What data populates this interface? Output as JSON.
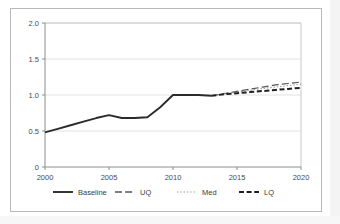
{
  "figure": {
    "frame_border_color": "#b9b9b9",
    "background_color": "#ffffff"
  },
  "chart_data": {
    "type": "line",
    "title": "",
    "subtitle": "",
    "xlabel": "",
    "ylabel": "",
    "xlim": [
      2000,
      2020
    ],
    "ylim": [
      0,
      2.0
    ],
    "xticks": [
      2000,
      2005,
      2010,
      2015,
      2020
    ],
    "xticklabels": [
      "2000",
      "2005",
      "2010",
      "2015",
      "2020"
    ],
    "yticks": [
      0,
      0.5,
      1.0,
      1.5,
      2.0
    ],
    "yticklabels": [
      "0",
      "0.5",
      "1.0",
      "1.5",
      "2.0"
    ],
    "grid": "horizontal",
    "legend_position": "bottom",
    "x": [
      2000,
      2001,
      2002,
      2003,
      2004,
      2005,
      2006,
      2007,
      2008,
      2009,
      2010,
      2011,
      2012,
      2013,
      2014,
      2015,
      2016,
      2017,
      2018,
      2019,
      2020
    ],
    "series": [
      {
        "name": "Baseline",
        "style": "solid",
        "color": "#2b2b2b",
        "width": 1.9,
        "values": [
          0.48,
          0.53,
          0.58,
          0.63,
          0.68,
          0.72,
          0.68,
          0.68,
          0.69,
          0.83,
          1.0,
          1.0,
          1.0,
          0.99,
          null,
          null,
          null,
          null,
          null,
          null,
          null
        ]
      },
      {
        "name": "UQ",
        "style": "long-dash",
        "color": "#555555",
        "width": 1.2,
        "values": [
          null,
          null,
          null,
          null,
          null,
          null,
          null,
          null,
          null,
          null,
          null,
          null,
          null,
          0.99,
          1.02,
          1.05,
          1.08,
          1.11,
          1.14,
          1.16,
          1.18
        ]
      },
      {
        "name": "Med",
        "style": "dotted",
        "color": "#9a9a9a",
        "width": 1.1,
        "values": [
          null,
          null,
          null,
          null,
          null,
          null,
          null,
          null,
          null,
          null,
          null,
          null,
          null,
          0.99,
          1.015,
          1.04,
          1.065,
          1.09,
          1.11,
          1.13,
          1.15
        ]
      },
      {
        "name": "LQ",
        "style": "dash",
        "color": "#1f1f1f",
        "width": 2.0,
        "values": [
          null,
          null,
          null,
          null,
          null,
          null,
          null,
          null,
          null,
          null,
          null,
          null,
          null,
          0.99,
          1.01,
          1.025,
          1.04,
          1.055,
          1.07,
          1.085,
          1.1
        ]
      }
    ],
    "legend": [
      {
        "label": "Baseline",
        "style": "solid",
        "color": "#2b2b2b"
      },
      {
        "label": "UQ",
        "style": "long-dash",
        "color": "#555555"
      },
      {
        "label": "Med",
        "style": "dotted",
        "color": "#9a9a9a"
      },
      {
        "label": "LQ",
        "style": "dash",
        "color": "#1f1f1f"
      }
    ]
  }
}
